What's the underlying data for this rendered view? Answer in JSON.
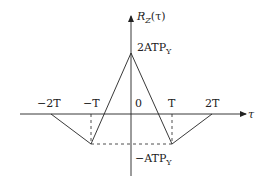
{
  "diagram": {
    "y_axis_label": "R_Z(τ)",
    "x_axis_label": "τ",
    "peak_label": "2ATP_Y",
    "min_label": "−ATP_Y",
    "origin_label": "0",
    "x_ticks": [
      "−2T",
      "−T",
      "T",
      "2T"
    ],
    "points": [
      {
        "tau": "−2T",
        "value": 0
      },
      {
        "tau": "−T",
        "value": "−ATP_Y"
      },
      {
        "tau": "0",
        "value": "2ATP_Y"
      },
      {
        "tau": "T",
        "value": "−ATP_Y"
      },
      {
        "tau": "2T",
        "value": 0
      }
    ]
  },
  "labels": {
    "y_axis_main": "R",
    "y_axis_sub": "Z",
    "y_axis_arg": "(τ)",
    "peak_main": "2ATP",
    "peak_sub": "Y",
    "min_main": "−ATP",
    "min_sub": "Y",
    "origin": "0",
    "tau": "τ",
    "tick_m2T": "−2T",
    "tick_mT": "−T",
    "tick_T": "T",
    "tick_2T": "2T"
  },
  "colors": {
    "line": "#222222",
    "background": "#ffffff"
  }
}
